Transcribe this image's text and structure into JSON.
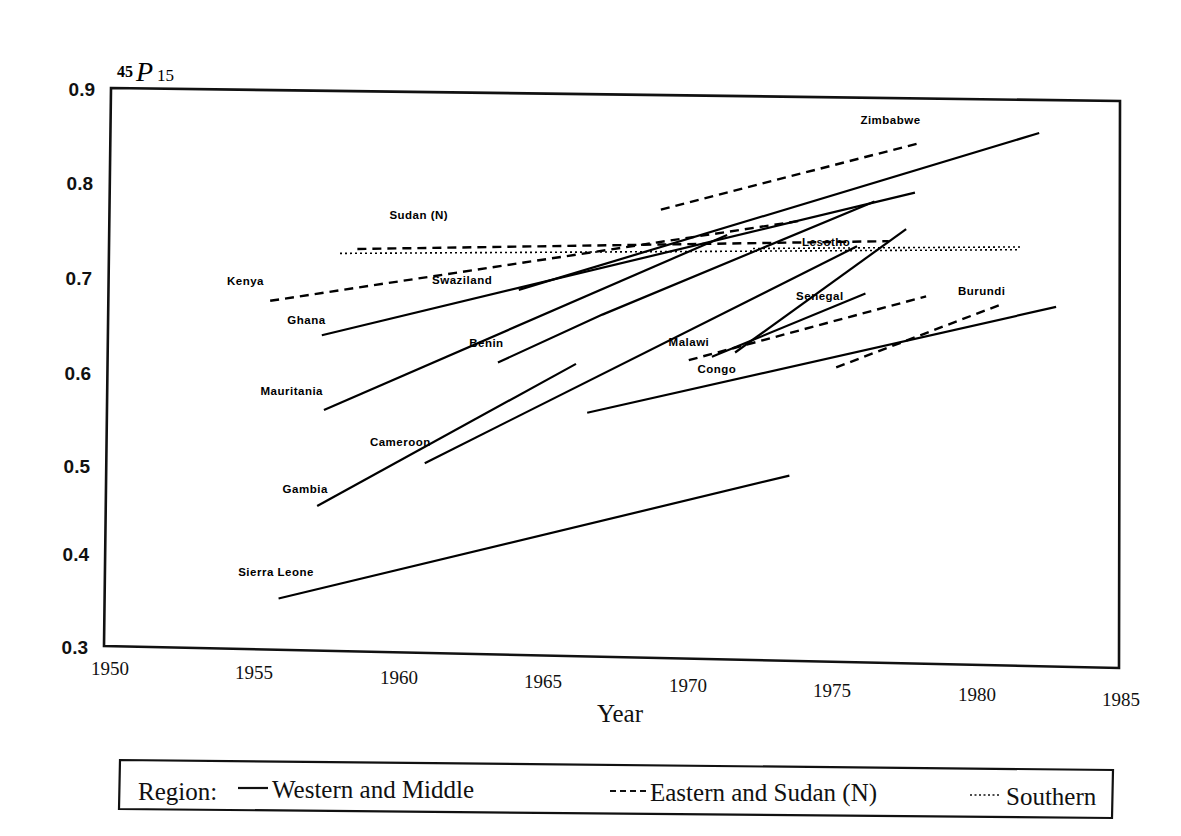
{
  "chart_data": {
    "type": "line",
    "title": "",
    "ylabel": "45P15",
    "ylabel_parts": {
      "pre": "45",
      "sym": "P",
      "sub": "15"
    },
    "xlabel": "Year",
    "xlim": [
      1950,
      1985
    ],
    "ylim": [
      0.3,
      0.9
    ],
    "grid": false,
    "xticks": [
      "1950",
      "1955",
      "1960",
      "1965",
      "1970",
      "1975",
      "1980",
      "1985"
    ],
    "yticks": [
      "0.3",
      "0.4",
      "0.5",
      "0.6",
      "0.7",
      "0.8",
      "0.9"
    ],
    "legend": {
      "position": "below-plot",
      "prefix": "Region:",
      "entries": [
        {
          "label": "Western and Middle",
          "style": "solid"
        },
        {
          "label": "Eastern and Sudan (N)",
          "style": "dashed"
        },
        {
          "label": "Southern",
          "style": "dotted"
        }
      ]
    },
    "series": [
      {
        "name": "Sierra Leone",
        "region": "Western and Middle",
        "style": "solid",
        "x": [
          1956.0,
          1973.6
        ],
        "y": [
          0.355,
          0.497
        ],
        "label_x": 1954.6,
        "label_y": 0.378,
        "label_anchor": "start"
      },
      {
        "name": "Gambia",
        "region": "Western and Middle",
        "style": "solid",
        "x": [
          1957.3,
          1966.2
        ],
        "y": [
          0.455,
          0.612
        ],
        "label_x": 1956.1,
        "label_y": 0.468,
        "label_anchor": "start"
      },
      {
        "name": "Cameroon",
        "region": "Western and Middle",
        "style": "solid",
        "x": [
          1961.0,
          1975.9
        ],
        "y": [
          0.503,
          0.742
        ],
        "label_x": 1959.1,
        "label_y": 0.52,
        "label_anchor": "start"
      },
      {
        "name": "Mauritania",
        "region": "Western and Middle",
        "style": "solid",
        "x": [
          1957.5,
          1971.4
        ],
        "y": [
          0.558,
          0.752
        ],
        "label_x": 1955.3,
        "label_y": 0.573,
        "label_anchor": "start"
      },
      {
        "name": "Ghana",
        "region": "Western and Middle",
        "style": "solid",
        "x": [
          1957.4,
          1977.9
        ],
        "y": [
          0.638,
          0.8
        ],
        "label_x": 1956.2,
        "label_y": 0.65,
        "label_anchor": "start"
      },
      {
        "name": "Benin",
        "region": "Western and Middle",
        "style": "solid",
        "x": [
          1963.5,
          1967.1,
          1976.5
        ],
        "y": [
          0.612,
          0.665,
          0.79
        ],
        "label_x": 1962.5,
        "label_y": 0.628,
        "label_anchor": "start"
      },
      {
        "name": "Congo",
        "region": "Western and Middle",
        "style": "solid",
        "x": [
          1970.9,
          1976.2
        ],
        "y": [
          0.622,
          0.692
        ],
        "label_x": 1970.4,
        "label_y": 0.605,
        "label_anchor": "start"
      },
      {
        "name": "Senegal",
        "region": "Western and Middle",
        "style": "solid",
        "x": [
          1971.7,
          1977.6
        ],
        "y": [
          0.627,
          0.761
        ],
        "label_x": 1973.8,
        "label_y": 0.684,
        "label_anchor": "start"
      },
      {
        "name": "Zimbabwe",
        "region": "Eastern and Sudan (N)",
        "style": "dashed",
        "x": [
          1969.1,
          1978.1
        ],
        "y": [
          0.778,
          0.853
        ],
        "label_x": 1976.0,
        "label_y": 0.872,
        "label_anchor": "start"
      },
      {
        "name": "Sudan (N)",
        "region": "Eastern and Sudan (N)",
        "style": "dashed",
        "x": [
          1958.6,
          1977.0
        ],
        "y": [
          0.731,
          0.748
        ],
        "label_x": 1959.7,
        "label_y": 0.764,
        "label_anchor": "start"
      },
      {
        "name": "Kenya",
        "region": "Eastern and Sudan (N)",
        "style": "dashed",
        "x": [
          1955.6,
          1973.9
        ],
        "y": [
          0.674,
          0.768
        ],
        "label_x": 1954.1,
        "label_y": 0.69,
        "label_anchor": "start"
      },
      {
        "name": "Malawi",
        "region": "Eastern and Sudan (N)",
        "style": "dashed",
        "x": [
          1970.1,
          1978.3
        ],
        "y": [
          0.618,
          0.69
        ],
        "label_x": 1969.4,
        "label_y": 0.633,
        "label_anchor": "start"
      },
      {
        "name": "Burundi",
        "region": "Eastern and Sudan (N)",
        "style": "dashed",
        "x": [
          1975.2,
          1981.0
        ],
        "y": [
          0.613,
          0.684
        ],
        "label_x": 1979.4,
        "label_y": 0.692,
        "label_anchor": "start"
      },
      {
        "name": "Swaziland",
        "region": "Southern",
        "style": "dotted",
        "x": [
          1958.0,
          1981.5
        ],
        "y": [
          0.726,
          0.741
        ],
        "label_x": 1961.2,
        "label_y": 0.695,
        "label_anchor": "start"
      },
      {
        "name": "Lesotho",
        "region": "Southern",
        "style": "dotted",
        "x": [
          1972.3,
          1981.6
        ],
        "y": [
          0.738,
          0.744
        ],
        "label_x": 1974.0,
        "label_y": 0.742,
        "label_anchor": "start"
      }
    ],
    "unlabeled_series": [
      {
        "name": "unlabeled-western-top",
        "region": "Western and Middle",
        "style": "solid",
        "x": [
          1964.2,
          1982.2
        ],
        "y": [
          0.69,
          0.865
        ]
      },
      {
        "name": "unlabeled-western-lower",
        "region": "Western and Middle",
        "style": "solid",
        "x": [
          1966.6,
          1982.8
        ],
        "y": [
          0.56,
          0.681
        ]
      }
    ]
  }
}
